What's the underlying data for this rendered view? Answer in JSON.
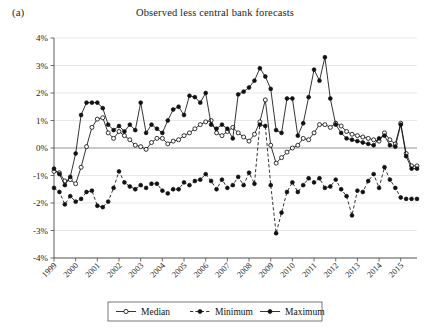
{
  "panel": {
    "label": "(a)"
  },
  "chart_data": {
    "type": "line",
    "title": "Observed less central bank forecasts",
    "xlabel": "",
    "ylabel": "",
    "ylim": [
      -4,
      4
    ],
    "yticks": [
      4,
      3,
      2,
      1,
      0,
      -1,
      -2,
      -3,
      -4
    ],
    "ytick_labels": [
      "4%",
      "3%",
      "2%",
      "1%",
      "0%",
      "-1%",
      "-2%",
      "-3%",
      "-4%"
    ],
    "grid": true,
    "legend_position": "bottom",
    "x_axis_type": "quarterly",
    "xlim": [
      1999.0,
      2015.75
    ],
    "xticks": [
      1999,
      2000,
      2001,
      2002,
      2003,
      2004,
      2005,
      2006,
      2007,
      2008,
      2009,
      2010,
      2011,
      2012,
      2013,
      2014,
      2015
    ],
    "xtick_labels": [
      "1999",
      "2000",
      "2001",
      "2002",
      "2003",
      "2004",
      "2005",
      "2006",
      "2007",
      "2008",
      "2009",
      "2010",
      "2011",
      "2012",
      "2013",
      "2014",
      "2015"
    ],
    "x": [
      1999.0,
      1999.25,
      1999.5,
      1999.75,
      2000.0,
      2000.25,
      2000.5,
      2000.75,
      2001.0,
      2001.25,
      2001.5,
      2001.75,
      2002.0,
      2002.25,
      2002.5,
      2002.75,
      2003.0,
      2003.25,
      2003.5,
      2003.75,
      2004.0,
      2004.25,
      2004.5,
      2004.75,
      2005.0,
      2005.25,
      2005.5,
      2005.75,
      2006.0,
      2006.25,
      2006.5,
      2006.75,
      2007.0,
      2007.25,
      2007.5,
      2007.75,
      2008.0,
      2008.25,
      2008.5,
      2008.75,
      2009.0,
      2009.25,
      2009.5,
      2009.75,
      2010.0,
      2010.25,
      2010.5,
      2010.75,
      2011.0,
      2011.25,
      2011.5,
      2011.75,
      2012.0,
      2012.25,
      2012.5,
      2012.75,
      2013.0,
      2013.25,
      2013.5,
      2013.75,
      2014.0,
      2014.25,
      2014.5,
      2014.75,
      2015.0,
      2015.25,
      2015.5,
      2015.75
    ],
    "series": [
      {
        "name": "Median",
        "marker": "open-circle",
        "linestyle": "solid",
        "values": [
          -0.85,
          -0.9,
          -1.2,
          -1.15,
          -1.3,
          -0.7,
          0.05,
          0.75,
          1.05,
          1.1,
          0.55,
          0.35,
          0.6,
          0.45,
          0.3,
          0.1,
          0.05,
          -0.05,
          0.2,
          0.35,
          0.35,
          0.15,
          0.25,
          0.3,
          0.45,
          0.55,
          0.7,
          0.85,
          0.95,
          1.0,
          0.55,
          0.45,
          0.6,
          0.75,
          0.55,
          0.4,
          0.25,
          0.5,
          0.95,
          1.75,
          0.1,
          -0.55,
          -0.35,
          -0.15,
          0.0,
          0.1,
          0.35,
          0.3,
          0.55,
          0.85,
          0.85,
          0.75,
          0.9,
          0.8,
          0.6,
          0.5,
          0.45,
          0.4,
          0.35,
          0.3,
          0.25,
          0.55,
          0.3,
          0.15,
          0.9,
          -0.2,
          -0.65,
          -0.65
        ]
      },
      {
        "name": "Minimum",
        "marker": "filled-circle",
        "linestyle": "dashed",
        "values": [
          -1.45,
          -1.6,
          -2.05,
          -1.75,
          -1.95,
          -1.85,
          -1.6,
          -1.55,
          -2.1,
          -2.15,
          -1.95,
          -1.45,
          -0.85,
          -1.25,
          -1.4,
          -1.5,
          -1.35,
          -1.45,
          -1.3,
          -1.3,
          -1.55,
          -1.65,
          -1.5,
          -1.5,
          -1.25,
          -1.35,
          -1.2,
          -1.15,
          -0.95,
          -1.2,
          -1.5,
          -1.15,
          -1.45,
          -1.35,
          -1.05,
          -1.35,
          -0.9,
          -1.3,
          0.85,
          0.8,
          -1.35,
          -3.1,
          -2.35,
          -1.6,
          -1.25,
          -1.6,
          -1.35,
          -1.1,
          -1.25,
          -1.1,
          -1.45,
          -1.4,
          -1.15,
          -1.5,
          -1.75,
          -2.45,
          -1.55,
          -1.6,
          -1.2,
          -0.95,
          -1.45,
          -0.7,
          -1.15,
          -1.45,
          -1.8,
          -1.85,
          -1.85,
          -1.85
        ]
      },
      {
        "name": "Maximum",
        "marker": "filled-circle",
        "linestyle": "solid",
        "values": [
          -0.75,
          -0.95,
          -1.35,
          -1.05,
          -0.2,
          1.2,
          1.65,
          1.65,
          1.65,
          1.45,
          0.85,
          0.65,
          0.8,
          0.6,
          0.85,
          0.65,
          1.65,
          0.55,
          0.85,
          0.7,
          0.55,
          1.0,
          1.4,
          1.5,
          1.2,
          1.9,
          1.85,
          1.65,
          2.0,
          0.85,
          0.7,
          0.85,
          0.7,
          0.35,
          1.95,
          2.05,
          2.2,
          2.45,
          2.9,
          2.6,
          2.15,
          0.65,
          0.55,
          1.8,
          1.8,
          0.45,
          0.9,
          1.85,
          2.85,
          2.45,
          3.3,
          1.8,
          0.85,
          0.55,
          0.35,
          0.3,
          0.25,
          0.2,
          0.15,
          0.1,
          0.35,
          0.45,
          0.1,
          0.05,
          0.85,
          -0.3,
          -0.75,
          -0.75
        ]
      }
    ]
  },
  "legend": {
    "items": [
      {
        "label": "Median"
      },
      {
        "label": "Minimum"
      },
      {
        "label": "Maximum"
      }
    ]
  }
}
